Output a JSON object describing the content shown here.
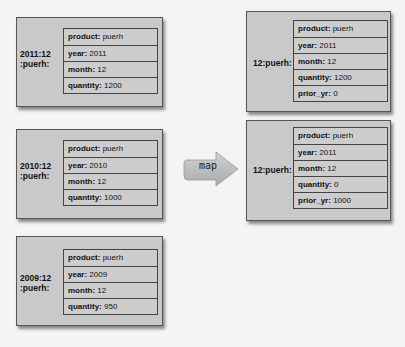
{
  "left_records": [
    {
      "key_line1": "2011:12",
      "key_line2": ":puerh:",
      "fields": [
        {
          "k": "product:",
          "v": " puerh"
        },
        {
          "k": "year:",
          "v": " 2011"
        },
        {
          "k": "month:",
          "v": " 12"
        },
        {
          "k": "quantity:",
          "v": " 1200"
        }
      ]
    },
    {
      "key_line1": "2010:12",
      "key_line2": ":puerh:",
      "fields": [
        {
          "k": "product:",
          "v": " puerh"
        },
        {
          "k": "year:",
          "v": " 2010"
        },
        {
          "k": "month:",
          "v": " 12"
        },
        {
          "k": "quantity:",
          "v": " 1000"
        }
      ]
    },
    {
      "key_line1": "2009:12",
      "key_line2": ":puerh:",
      "fields": [
        {
          "k": "product:",
          "v": " puerh"
        },
        {
          "k": "year:",
          "v": " 2009"
        },
        {
          "k": "month:",
          "v": " 12"
        },
        {
          "k": "quantity:",
          "v": " 950"
        }
      ]
    }
  ],
  "arrow": {
    "label": "map"
  },
  "right_records": [
    {
      "key": "12:puerh:",
      "fields": [
        {
          "k": "product:",
          "v": " puerh"
        },
        {
          "k": "year:",
          "v": " 2011"
        },
        {
          "k": "month:",
          "v": " 12"
        },
        {
          "k": "quantity:",
          "v": " 1200"
        },
        {
          "k": "prior_yr:",
          "v": " 0"
        }
      ]
    },
    {
      "key": "12:puerh:",
      "fields": [
        {
          "k": "product:",
          "v": " puerh"
        },
        {
          "k": "year:",
          "v": " 2011"
        },
        {
          "k": "month:",
          "v": " 12"
        },
        {
          "k": "quantity:",
          "v": " 0"
        },
        {
          "k": "prior_yr:",
          "v": " 1000"
        }
      ]
    }
  ]
}
